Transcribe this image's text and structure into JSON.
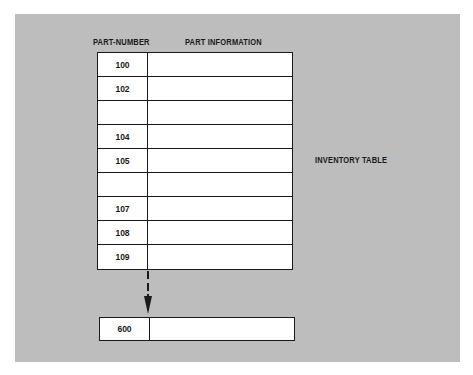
{
  "diagram": {
    "title_label": "INVENTORY TABLE",
    "columns": {
      "part_number": "PART-NUMBER",
      "part_information": "PART INFORMATION"
    },
    "rows": [
      {
        "part_number": "100",
        "part_information": ""
      },
      {
        "part_number": "102",
        "part_information": ""
      },
      {
        "part_number": "",
        "part_information": ""
      },
      {
        "part_number": "104",
        "part_information": ""
      },
      {
        "part_number": "105",
        "part_information": ""
      },
      {
        "part_number": "",
        "part_information": ""
      },
      {
        "part_number": "107",
        "part_information": ""
      },
      {
        "part_number": "108",
        "part_information": ""
      },
      {
        "part_number": "109",
        "part_information": ""
      }
    ],
    "last_row": {
      "part_number": "600",
      "part_information": ""
    },
    "continuation": "dashed-arrow-down",
    "colors": {
      "background_panel": "#bdbdbd",
      "cell_fill": "#ffffff",
      "line": "#1a1a1a"
    }
  }
}
